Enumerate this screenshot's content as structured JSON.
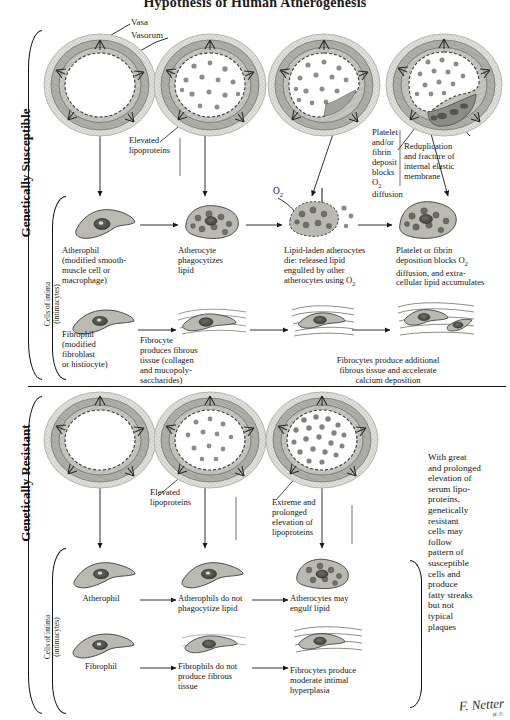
{
  "page": {
    "title": "Hypothesis of Human Atherogenesis",
    "signature": "F. Netter",
    "signature_sub": "M.D."
  },
  "sections": [
    {
      "id": "susceptible",
      "label": "Genetically Susceptible",
      "sub_label_line1": "Cells of intima",
      "sub_label_line2": "(intimacytes)"
    },
    {
      "id": "resistant",
      "label": "Genetically Resistant",
      "sub_label_line1": "Cells of intima",
      "sub_label_line2": "(intimacytes)"
    }
  ],
  "annotations": {
    "vasa": "Vasa",
    "vasorum": "Vasorum",
    "oxygen": "O2"
  },
  "susceptible_vessel_captions": [
    {
      "text": ""
    },
    {
      "text": "Elevated\nlipoproteins"
    },
    {
      "text": ""
    },
    {
      "text": "Platelet\nand/or\nfibrin\ndeposit\nblocks O2\ndiffusion"
    },
    {
      "text": "Reduplication\nand fracture of\ninternal elastic\nmembrane"
    }
  ],
  "susceptible_athero_captions": [
    "Atherophil\n(modified smooth-\nmuscle cell or\nmacrophage)",
    "Atherocyte\nphagocytizes\nlipid",
    "Lipid-laden atherocytes\ndie: released lipid\nengulfed by other\natherocytes using O2",
    "Platelet or fibrin\ndeposition blocks O2\ndiffusion, and extra-\ncellular lipid accumulates"
  ],
  "susceptible_fibro_captions": [
    "Fibrophil\n(modified\nfibroblast\nor histiocyte)",
    "Fibrocyte\nproduces fibrous\ntissue (collagen\nand mucopoly-\nsaccharides)",
    "Fibrocytes produce additional\nfibrous tissue and accelerate\ncalcium deposition"
  ],
  "resistant_vessel_captions": [
    "",
    "Elevated\nlipoproteins",
    "Extreme and\nprolonged\nelevation of\nlipoproteins"
  ],
  "resistant_note": "With great\nand prolonged\nelevation of\nserum lipo-\nproteins,\ngenetically\nresistant\ncells may\nfollow\npattern of\nsusceptible\ncells and\nproduce\nfatty streaks\nbut not\ntypical\nplaques",
  "resistant_athero_captions": [
    "Atherophil",
    "Atherophils do not\nphagocytize lipid",
    "Atherocytes may\nengulf lipid"
  ],
  "resistant_fibro_captions": [
    "Fibrophil",
    "Fibrophils do not\nproduce fibrous\ntissue",
    "Fibrocytes produce\nmoderate intimal\nhyperplasia"
  ],
  "colors": {
    "ink": "#161616",
    "media_gray": "#9a9a96",
    "media_dark": "#6d6d69",
    "lipid": "#8f8f8b",
    "adventitia": "#c9c9c4",
    "plaque": "#7c7c78"
  }
}
